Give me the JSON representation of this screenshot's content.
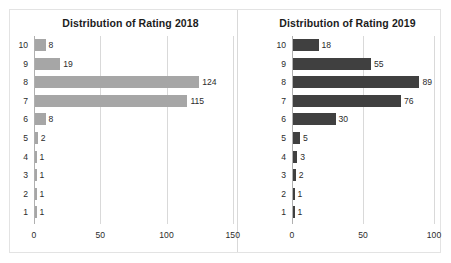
{
  "chart_data": [
    {
      "type": "bar",
      "orientation": "horizontal",
      "title": "Distribution of Rating 2018",
      "xlabel": "",
      "ylabel": "",
      "categories": [
        "10",
        "9",
        "8",
        "7",
        "6",
        "5",
        "4",
        "3",
        "2",
        "1"
      ],
      "values": [
        8,
        19,
        124,
        115,
        8,
        2,
        1,
        1,
        1,
        1
      ],
      "value_labels": [
        "8",
        "19",
        "124",
        "115",
        "8",
        "2",
        "1",
        "1",
        "1",
        "1"
      ],
      "xlim": [
        0,
        150
      ],
      "xticks": [
        0,
        50,
        100,
        150
      ],
      "xtick_labels": [
        "0",
        "50",
        "100",
        "150"
      ],
      "grid": true,
      "legend": false,
      "bar_color": "#a6a6a6"
    },
    {
      "type": "bar",
      "orientation": "horizontal",
      "title": "Distribution of Rating 2019",
      "xlabel": "",
      "ylabel": "",
      "categories": [
        "10",
        "9",
        "8",
        "7",
        "6",
        "5",
        "4",
        "3",
        "2",
        "1"
      ],
      "values": [
        18,
        55,
        89,
        76,
        30,
        5,
        3,
        2,
        1,
        1
      ],
      "value_labels": [
        "18",
        "55",
        "89",
        "76",
        "30",
        "5",
        "3",
        "2",
        "1",
        "1"
      ],
      "xlim": [
        0,
        115
      ],
      "xticks": [
        0,
        50,
        100
      ],
      "xtick_labels": [
        "0",
        "50",
        "100"
      ],
      "grid": true,
      "legend": false,
      "bar_color": "#404040"
    }
  ],
  "colors": {
    "bar_2018": "#a6a6a6",
    "bar_2019": "#404040",
    "gridline": "#d9d9d9",
    "frame": "#e3e3e3",
    "text": "#2b2b2b",
    "title": "#1c1c1c",
    "background": "#ffffff"
  }
}
